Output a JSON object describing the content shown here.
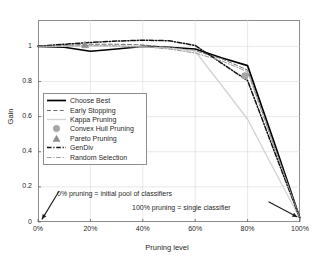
{
  "chart_data": {
    "type": "line",
    "title": "",
    "xlabel": "Pruning level",
    "ylabel": "Gain",
    "xlim": [
      0,
      100
    ],
    "ylim": [
      0,
      1.15
    ],
    "grid": true,
    "legend_position": "center-left",
    "xticks": [
      "0%",
      "20%",
      "40%",
      "60%",
      "80%",
      "100%"
    ],
    "xtick_values": [
      0,
      20,
      40,
      60,
      80,
      100
    ],
    "yticks": [
      "0",
      "0.2",
      "0.4",
      "0.6",
      "0.8",
      "1"
    ],
    "ytick_values": [
      0,
      0.2,
      0.4,
      0.6,
      0.8,
      1
    ],
    "x": [
      0,
      10,
      20,
      30,
      40,
      50,
      60,
      70,
      80,
      90,
      100
    ],
    "series": [
      {
        "name": "Choose Best",
        "style": "solid",
        "color": "#000000",
        "width": 1.7,
        "values": [
          1.0,
          0.995,
          0.972,
          0.985,
          1.0,
          0.995,
          0.985,
          0.935,
          0.89,
          0.46,
          0.02
        ]
      },
      {
        "name": "Early Stopping",
        "style": "dashed",
        "color": "#6e6e6e",
        "width": 1.0,
        "values": [
          1.0,
          1.005,
          1.012,
          1.012,
          1.008,
          0.995,
          0.975,
          0.93,
          0.865,
          0.44,
          0.02
        ]
      },
      {
        "name": "Kappa Pruning",
        "style": "solid",
        "color": "#d2d2d2",
        "width": 1.3,
        "values": [
          1.0,
          1.0,
          1.0,
          1.0,
          0.997,
          0.99,
          0.972,
          0.78,
          0.585,
          0.3,
          0.02
        ]
      },
      {
        "name": "Convex Hull Pruning",
        "style": "marker-circle",
        "color": "#a8a8a8",
        "width": 0,
        "marker_points": [
          {
            "x": 79,
            "y": 0.832
          }
        ]
      },
      {
        "name": "Pareto Pruning",
        "style": "marker-triangle",
        "color": "#8f8f8f",
        "width": 0,
        "marker_points": [
          {
            "x": 18,
            "y": 1.008
          }
        ]
      },
      {
        "name": "GenDiv",
        "style": "dashdot",
        "color": "#111111",
        "width": 1.5,
        "values": [
          1.0,
          1.012,
          1.022,
          1.03,
          1.035,
          1.032,
          1.005,
          0.905,
          0.805,
          0.41,
          0.02
        ]
      },
      {
        "name": "Random Selection",
        "style": "dashdot",
        "color": "#9a9a9a",
        "width": 1.0,
        "values": [
          1.0,
          1.002,
          1.005,
          1.003,
          0.998,
          0.985,
          0.962,
          0.918,
          0.855,
          0.435,
          0.02
        ]
      }
    ],
    "annotations": [
      {
        "text": "0% pruning = initial pool of classifiers",
        "arrow_from": {
          "x": 8,
          "y": 0.175
        },
        "arrow_to": {
          "x": 1.5,
          "y": 0.015
        }
      },
      {
        "text": "100% pruning = single classifier",
        "arrow_from": {
          "x": 88,
          "y": 0.115
        },
        "arrow_to": {
          "x": 99,
          "y": 0.028
        }
      }
    ]
  },
  "axis": {
    "ylabel": "Gain",
    "xlabel": "Pruning level"
  }
}
